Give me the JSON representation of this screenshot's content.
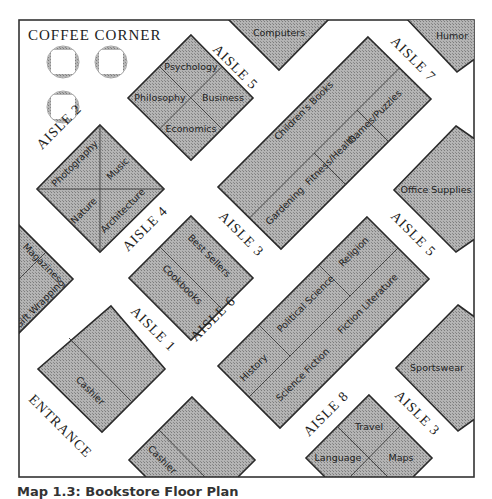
{
  "map": {
    "title": "COFFEE CORNER",
    "entrance": "ENTRANCE",
    "caption": "Map 1.3: Bookstore Floor Plan",
    "colors": {
      "shelf_fill": "#a8a8a8",
      "border": "#2a2a2a",
      "background": "#ffffff"
    }
  },
  "aisles": {
    "a1": "AISLE 1",
    "a2": "AISLE 2",
    "a3_top": "AISLE 3",
    "a3_bottom": "AISLE 3",
    "a4": "AISLE 4",
    "a5_top": "AISLE 5",
    "a5_right": "AISLE 5",
    "a6": "AISLE 6",
    "a7": "AISLE 7",
    "a8": "AISLE 8"
  },
  "sections": {
    "computers": "Computers",
    "humor": "Humor",
    "psychology": "Psychology",
    "philosophy": "Philosophy",
    "business": "Business",
    "economics": "Economics",
    "childrens_books": "Children's Books",
    "gardening": "Gardening",
    "fitness_health": "Fitness/Health",
    "games_puzzles": "Games/Puzzles",
    "office_supplies": "Office Supplies",
    "photography": "Photography",
    "music": "Music",
    "nature": "Nature",
    "architecture": "Architecture",
    "magazines": "Magazines",
    "gift_wrapping": "Gift Wrapping",
    "best_sellers": "Best Sellers",
    "cookbooks": "Cookbooks",
    "religion": "Religion",
    "political_science": "Political Science",
    "fiction_literature": "Fiction Literature",
    "history": "History",
    "science_fiction": "Science Fiction",
    "cashier_1": "Cashier",
    "cashier_2": "Cashier",
    "sportswear": "Sportswear",
    "travel": "Travel",
    "language": "Language",
    "maps": "Maps"
  }
}
